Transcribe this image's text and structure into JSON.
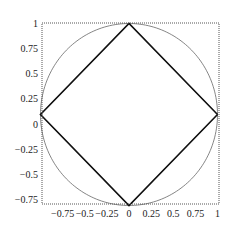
{
  "chart_data": {
    "type": "line",
    "title": "",
    "xlabel": "",
    "ylabel": "",
    "xlim": [
      -1.0,
      1.05
    ],
    "ylim": [
      -0.8,
      1.0
    ],
    "grid": false,
    "legend": null,
    "x_ticks": [
      "-0.75",
      "-0.5",
      "-0.25",
      "0",
      "0.25",
      "0.5",
      "0.75",
      "1"
    ],
    "y_ticks": [
      "1",
      "0.75",
      "0.5",
      "0.25",
      "0",
      "-0.25",
      "-0.5",
      "-0.75"
    ],
    "series": [
      {
        "name": "circle",
        "description": "unit circle x^2+y^2=1",
        "style": "thin gray",
        "points": [
          [
            1,
            0
          ],
          [
            0,
            1
          ],
          [
            -1,
            0
          ],
          [
            0,
            -1
          ]
        ]
      },
      {
        "name": "diamond",
        "description": "|x|+|y|=1",
        "style": "thick black",
        "points": [
          [
            1,
            0
          ],
          [
            0,
            1
          ],
          [
            -1,
            0
          ],
          [
            0,
            -1
          ],
          [
            1,
            0
          ]
        ]
      },
      {
        "name": "astroid",
        "description": "concave inner curve |x|^(2/3)+|y|^(2/3)=1 style, through (±1,0),(0,±1)",
        "style": "thin gray",
        "points": [
          [
            1,
            0
          ],
          [
            0,
            1
          ],
          [
            -1,
            0
          ],
          [
            0,
            -1
          ]
        ]
      }
    ]
  },
  "colors": {
    "frame": "#555555",
    "circle": "#666666",
    "diamond": "#111111",
    "astroid": "#666666"
  }
}
